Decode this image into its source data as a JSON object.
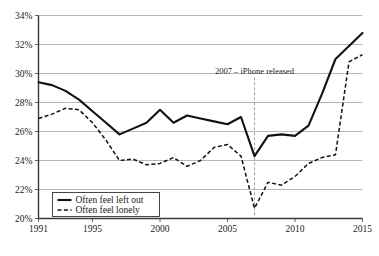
{
  "chart_data": {
    "type": "line",
    "title": "",
    "xlabel": "",
    "ylabel": "",
    "xlim": [
      1991,
      2015
    ],
    "ylim": [
      20,
      34
    ],
    "ytick_labels": [
      "20%",
      "22%",
      "24%",
      "26%",
      "28%",
      "30%",
      "32%",
      "34%"
    ],
    "ytick_values": [
      20,
      22,
      24,
      26,
      28,
      30,
      32,
      34
    ],
    "xtick_labels": [
      "1991",
      "1995",
      "2000",
      "2005",
      "2010",
      "2015"
    ],
    "xtick_values": [
      1991,
      1995,
      2000,
      2005,
      2010,
      2015
    ],
    "grid": "horizontal",
    "legend_position": "bottom-left",
    "x": [
      1991,
      1992,
      1993,
      1994,
      1995,
      1996,
      1997,
      1998,
      1999,
      2000,
      2001,
      2002,
      2003,
      2004,
      2005,
      2006,
      2007,
      2008,
      2009,
      2010,
      2011,
      2012,
      2013,
      2014,
      2015
    ],
    "series": [
      {
        "name": "Often feel left out",
        "style": "solid",
        "color": "#111111",
        "values": [
          29.4,
          29.2,
          28.8,
          28.2,
          27.4,
          26.6,
          25.8,
          26.2,
          26.6,
          27.5,
          26.6,
          27.1,
          26.9,
          26.7,
          26.5,
          27.0,
          24.3,
          25.7,
          25.8,
          25.7,
          26.4,
          28.6,
          31.0,
          31.9,
          32.8
        ]
      },
      {
        "name": "Often feel lonely",
        "style": "dashed",
        "color": "#111111",
        "values": [
          26.9,
          27.2,
          27.6,
          27.5,
          26.6,
          25.4,
          24.0,
          24.1,
          23.7,
          23.8,
          24.2,
          23.6,
          24.0,
          24.9,
          25.1,
          24.3,
          20.7,
          22.5,
          22.3,
          22.9,
          23.8,
          24.2,
          24.4,
          30.8,
          31.3
        ]
      }
    ],
    "annotations": [
      {
        "name": "iphone-release",
        "text": "2007 – iPhone released",
        "x": 2007,
        "label_y": 29.6
      }
    ]
  },
  "legend": {
    "items": [
      {
        "label": "Often feel left out",
        "style": "solid"
      },
      {
        "label": "Often feel lonely",
        "style": "dashed"
      }
    ]
  }
}
